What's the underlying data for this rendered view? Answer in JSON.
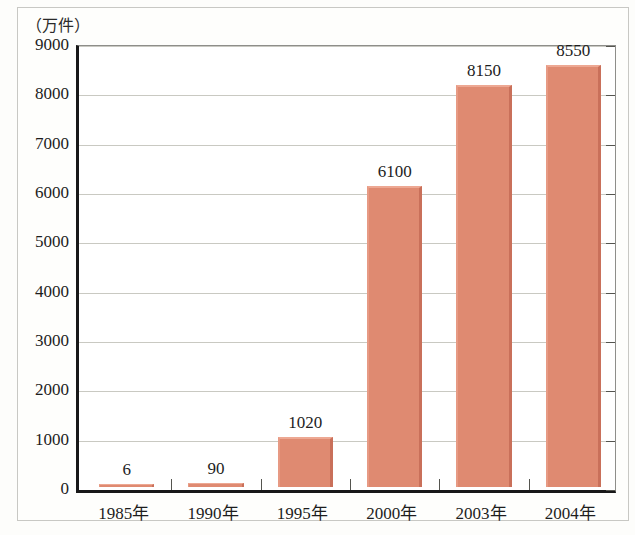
{
  "chart_data": {
    "type": "bar",
    "title": "",
    "subtitle": "",
    "unit_label": "（万件）",
    "xlabel": "",
    "ylabel": "",
    "categories": [
      "1985年",
      "1990年",
      "1995年",
      "2000年",
      "2003年",
      "2004年"
    ],
    "values": [
      6,
      90,
      1020,
      6100,
      8150,
      8550
    ],
    "value_labels": [
      "6",
      "90",
      "1020",
      "6100",
      "8150",
      "8550"
    ],
    "ylim": [
      0,
      9000
    ],
    "ytick_step": 1000,
    "ytick_labels": [
      "0",
      "1000",
      "2000",
      "3000",
      "4000",
      "5000",
      "6000",
      "7000",
      "8000",
      "9000"
    ],
    "grid": true,
    "legend": "none",
    "series": [
      {
        "name": "",
        "values": [
          6,
          90,
          1020,
          6100,
          8150,
          8550
        ]
      }
    ],
    "colors": {
      "bar_fill": "#df8a71",
      "bar_highlight": "#eda893",
      "bar_shadow": "#c9705a",
      "gridline": "#c9c9c2",
      "axis": "#181818",
      "text": "#1d1d1d",
      "background": "#ffffff",
      "page_background": "#fdfdfb",
      "page_border": "#c8c8c4"
    }
  }
}
